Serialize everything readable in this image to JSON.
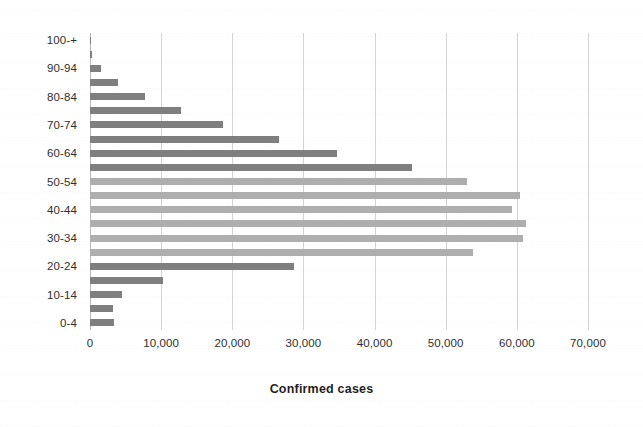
{
  "chart_data": {
    "type": "bar",
    "orientation": "horizontal",
    "title": "",
    "xlabel": "Confirmed cases",
    "ylabel": "",
    "xlim": [
      0,
      70000
    ],
    "ylim": null,
    "grid": true,
    "legend": null,
    "x_ticks": [
      0,
      10000,
      20000,
      30000,
      40000,
      50000,
      60000,
      70000
    ],
    "x_tick_labels": [
      "0",
      "10,000",
      "20,000",
      "30,000",
      "40,000",
      "50,000",
      "60,000",
      "70,000"
    ],
    "categories": [
      "0-4",
      "5-9",
      "10-14",
      "15-19",
      "20-24",
      "25-29",
      "30-34",
      "35-39",
      "40-44",
      "45-49",
      "50-54",
      "55-59",
      "60-64",
      "65-69",
      "70-74",
      "75-79",
      "80-84",
      "85-89",
      "90-94",
      "95-99",
      "100-+"
    ],
    "visible_category_labels": [
      "0-4",
      "10-14",
      "20-24",
      "30-34",
      "40-44",
      "50-54",
      "60-64",
      "70-74",
      "80-84",
      "90-94",
      "100-+"
    ],
    "values": [
      3400,
      3200,
      4500,
      10200,
      28700,
      53900,
      60800,
      61300,
      59300,
      60500,
      53000,
      45200,
      34700,
      26600,
      18700,
      12800,
      7800,
      3900,
      1500,
      300,
      120
    ],
    "bar_tone": [
      "dark",
      "dark",
      "dark",
      "dark",
      "dark",
      "light",
      "light",
      "light",
      "light",
      "light",
      "light",
      "dark",
      "dark",
      "dark",
      "dark",
      "dark",
      "dark",
      "dark",
      "dark",
      "dark",
      "dark"
    ],
    "colors": {
      "bar_dark": "#7f7f7f",
      "bar_light": "#aeaeae",
      "gridline": "#d2d2d2",
      "axis": "#b9b9b9",
      "text": "#2e2e2e",
      "background": "#ffffff"
    }
  }
}
